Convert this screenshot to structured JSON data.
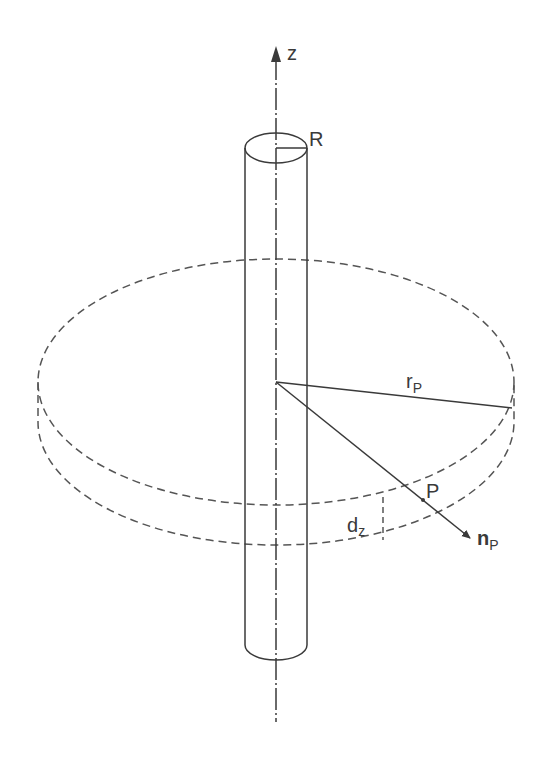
{
  "diagram": {
    "title": "",
    "colors": {
      "stroke": "#3a3a3a",
      "background": "#ffffff"
    },
    "labels": {
      "axis": "z",
      "radius": "R",
      "disc_radius": "r",
      "disc_radius_sub": "P",
      "point": "P",
      "normal": "n",
      "normal_sub": "P",
      "thickness": "d",
      "thickness_sub": "z"
    },
    "elements": [
      {
        "id": "z-axis",
        "type": "dash-dot line with arrow",
        "description": "vertical axis through cylinder center"
      },
      {
        "id": "cylinder",
        "type": "solid outline",
        "description": "thin vertical cylinder of radius R"
      },
      {
        "id": "disc",
        "type": "dashed ellipse pair",
        "description": "disc slab of thickness dz around cylinder"
      },
      {
        "id": "radius-line",
        "type": "solid line",
        "description": "r_P from axis to disc edge"
      },
      {
        "id": "normal-vector",
        "type": "solid arrow",
        "description": "n_P through point P"
      }
    ]
  }
}
